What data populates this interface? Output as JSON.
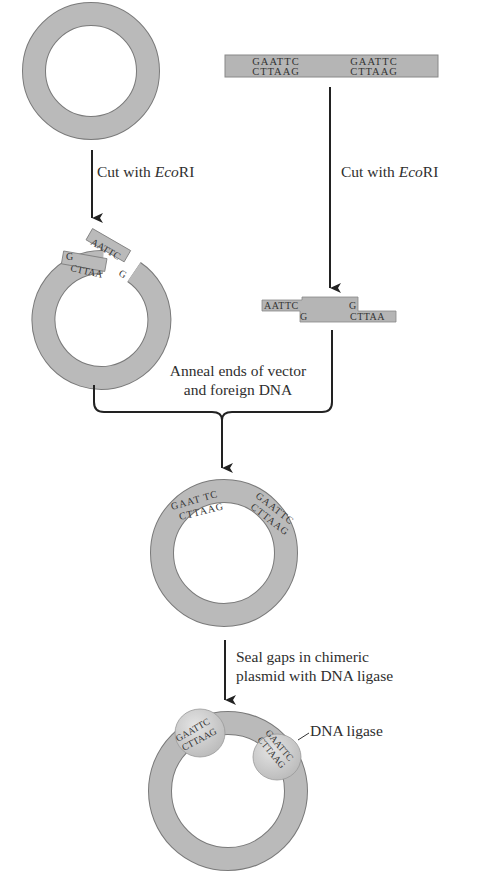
{
  "diagram": {
    "colors": {
      "dna": "#b8b8b8",
      "dna_stroke": "#7a7a7a",
      "ligase": "#d0d0d0",
      "arrow": "#222222",
      "text": "#2e2e2e"
    },
    "foreign_dna": {
      "site1_top": "GAATTC",
      "site1_bottom": "CTTAAG",
      "site2_top": "GAATTC",
      "site2_bottom": "CTTAAG"
    },
    "step1_left": {
      "label_prefix": "Cut with ",
      "label_enzyme": "Eco",
      "label_suffix": "RI"
    },
    "step1_right": {
      "label_prefix": "Cut with ",
      "label_enzyme": "Eco",
      "label_suffix": "RI"
    },
    "cut_vector": {
      "left_end_top": "G",
      "left_end_bottom": "CTTAA",
      "right_end_top": "AATTC",
      "right_end_bottom": "G"
    },
    "cut_fragment": {
      "left_top": "AATTC",
      "left_bottom": "G",
      "right_top": "G",
      "right_bottom": "CTTAA"
    },
    "step2": {
      "line1": "Anneal ends of vector",
      "line2": "and foreign DNA"
    },
    "annealed": {
      "site1_top": "GAAT TC",
      "site1_bottom": "CTTAAG",
      "site2_top": "GAATTC",
      "site2_bottom": "CTTAAG"
    },
    "step3": {
      "line1": "Seal gaps in chimeric",
      "line2": "plasmid with DNA ligase"
    },
    "ligated": {
      "site1_top": "GAATTC",
      "site1_bottom": "CTTAAG",
      "site2_top": "GAATTC",
      "site2_bottom": "CTTAAG",
      "ligase_label": "DNA ligase"
    }
  }
}
